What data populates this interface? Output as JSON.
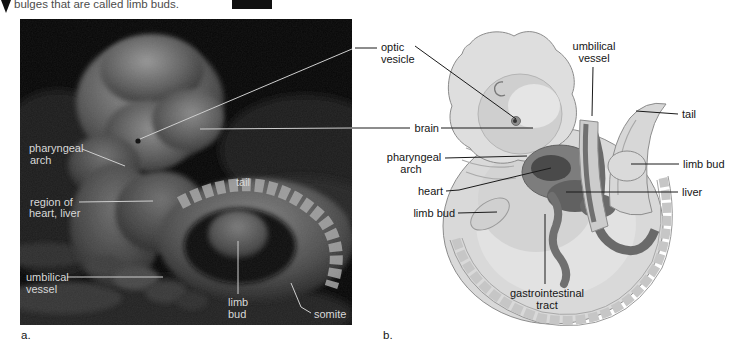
{
  "figure": {
    "top_caption": "bulges that are called limb buds.",
    "colors": {
      "page_background": "#ffffff",
      "sem_background": "#060606",
      "sem_label_text": "#d8d8d8",
      "sem_leader_line": "#cfcfcf",
      "label_text": "#151515",
      "leader_line": "#1a1a1a",
      "illustration_body": "#d9d9d9",
      "illustration_shadow": "#b9b9b9",
      "illustration_organ_dark": "#6e6e6e"
    },
    "panel_a": {
      "tag": "a.",
      "labels": {
        "pharyngeal_arch": {
          "line1": "pharyngeal",
          "line2": "arch"
        },
        "region_heart_liver": {
          "line1": "region of",
          "line2": "heart, liver"
        },
        "umbilical_vessel": {
          "line1": "umbilical",
          "line2": "vessel"
        },
        "tail": "tail",
        "limb_bud": {
          "line1": "limb",
          "line2": "bud"
        },
        "somite": "somite"
      }
    },
    "panel_b": {
      "tag": "b.",
      "labels": {
        "optic_vesicle": {
          "line1": "optic",
          "line2": "vesicle"
        },
        "umbilical_vessel": {
          "line1": "umbilical",
          "line2": "vessel"
        },
        "tail": "tail",
        "brain": "brain",
        "pharyngeal_arch": {
          "line1": "pharyngeal",
          "line2": "arch"
        },
        "limb_bud_right": "limb bud",
        "heart": "heart",
        "liver": "liver",
        "limb_bud_left": "limb bud",
        "gastrointestinal_tract": {
          "line1": "gastrointestinal",
          "line2": "tract"
        }
      }
    }
  }
}
